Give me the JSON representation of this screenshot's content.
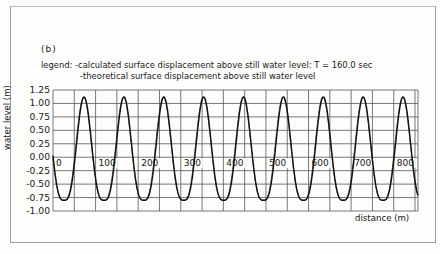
{
  "panel": "(b)",
  "legend": {
    "prefix": "legend:",
    "line1": "-calculated surface displacement above still water level: T = 160.0 sec",
    "line2": "-theoretical surface displacement above still water level"
  },
  "axes": {
    "ylabel": "water level (m)",
    "xlabel": "distance (m)",
    "yticks": [
      "1.25",
      "1.00",
      "0.75",
      "0.50",
      "0.25",
      "0.00",
      "-0.25",
      "-0.50",
      "-0.75",
      "-1.00"
    ],
    "xticks": [
      "0",
      "100",
      "200",
      "300",
      "400",
      "500",
      "600",
      "700",
      "800"
    ]
  },
  "chart_data": {
    "type": "line",
    "title": "(b)",
    "xlabel": "distance (m)",
    "ylabel": "water level (m)",
    "xlim": [
      0,
      857
    ],
    "ylim": [
      -1.0,
      1.25
    ],
    "grid": true,
    "x_grid_spacing": 50,
    "y_grid_spacing": 0.25,
    "legend": [
      "calculated surface displacement above still water level: T = 160.0 sec",
      "theoretical surface displacement above still water level"
    ],
    "annotations": [
      "T = 160.0 sec"
    ],
    "series": [
      {
        "name": "calculated surface displacement",
        "description": "periodic cnoidal-like wave, wavelength ~93 m, crest ~1.12 m, trough ~-0.80 m",
        "crest_x": [
          73,
          167,
          260,
          354,
          448,
          541,
          635,
          729,
          822
        ],
        "crest_y": 1.12,
        "trough_x": [
          22,
          116,
          210,
          303,
          397,
          491,
          584,
          678,
          772
        ],
        "trough_y": -0.8
      },
      {
        "name": "theoretical surface displacement",
        "description": "nearly coincident with calculated curve",
        "crest_y": 1.12,
        "trough_y": -0.8
      }
    ]
  }
}
